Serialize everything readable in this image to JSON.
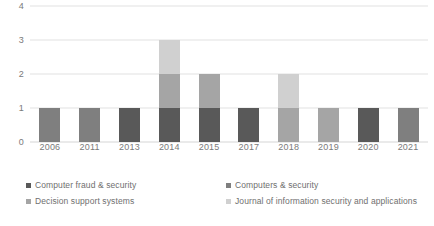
{
  "chart_data": {
    "type": "bar",
    "title": "",
    "subtitle": "",
    "xlabel": "",
    "ylabel": "",
    "stacked": true,
    "grid": true,
    "legend_position": "bottom",
    "ylim": [
      0,
      4
    ],
    "yticks": [
      "0",
      "1",
      "2",
      "3",
      "4"
    ],
    "categories": [
      "2006",
      "2011",
      "2013",
      "2014",
      "2015",
      "2017",
      "2018",
      "2019",
      "2020",
      "2021"
    ],
    "series": [
      {
        "name": "Computer fraud & security",
        "color": "#595959",
        "values": [
          0,
          0,
          1,
          1,
          1,
          1,
          0,
          0,
          1,
          0
        ]
      },
      {
        "name": "Computers & security",
        "color": "#7f7f7f",
        "values": [
          1,
          1,
          0,
          0,
          0,
          0,
          0,
          0,
          0,
          1
        ]
      },
      {
        "name": "Decision support systems",
        "color": "#a5a5a5",
        "values": [
          0,
          0,
          0,
          1,
          1,
          0,
          1,
          1,
          0,
          0
        ]
      },
      {
        "name": "Journal of information security and applications",
        "color": "#d0d0d0",
        "values": [
          0,
          0,
          0,
          1,
          0,
          0,
          1,
          0,
          0,
          0
        ]
      }
    ],
    "totals": [
      1,
      1,
      1,
      3,
      2,
      1,
      2,
      1,
      1,
      1
    ]
  },
  "axes": {
    "y_ticks": [
      "4",
      "3",
      "2",
      "1",
      "0"
    ],
    "x_ticks": [
      "2006",
      "2011",
      "2013",
      "2014",
      "2015",
      "2017",
      "2018",
      "2019",
      "2020",
      "2021"
    ]
  },
  "legend": {
    "items": [
      {
        "label": "Computer fraud & security",
        "color": "#595959"
      },
      {
        "label": "Computers & security",
        "color": "#7f7f7f"
      },
      {
        "label": "Decision support systems",
        "color": "#a5a5a5"
      },
      {
        "label": "Journal of information security and applications",
        "color": "#d0d0d0"
      }
    ]
  },
  "colors": {
    "background": "#ffffff",
    "gridline": "#e2e2e2",
    "baseline": "#d6d6d6",
    "text": "#7a7a7a"
  }
}
